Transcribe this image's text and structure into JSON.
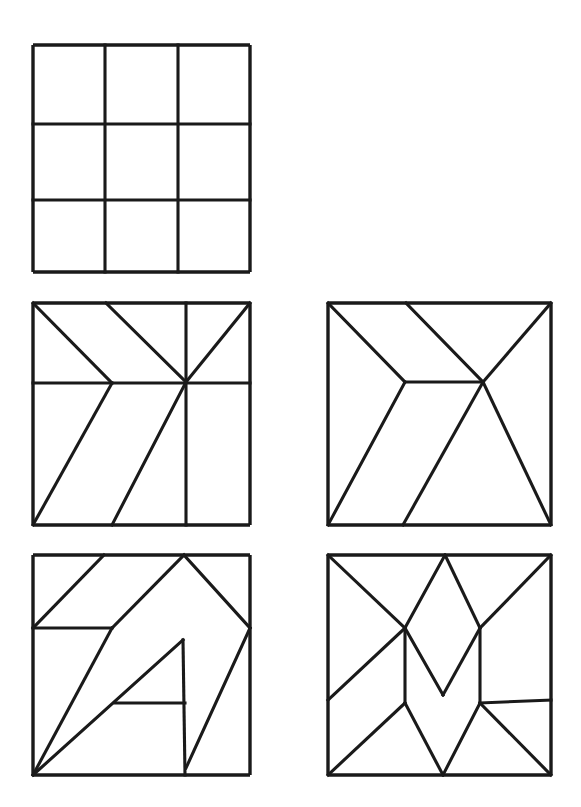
{
  "page": {
    "background_color": "#ffffff",
    "ink_color": "#1a1a1a",
    "width": 581,
    "height": 807
  },
  "figures": [
    {
      "id": "figure-1",
      "name": "three-by-three-grid",
      "label": "3x3 grid square",
      "box": {
        "x": 33,
        "y": 45,
        "w": 217,
        "h": 227
      },
      "segments": [
        [
          33,
          45,
          250,
          45
        ],
        [
          33,
          272,
          250,
          272
        ],
        [
          33,
          45,
          33,
          272
        ],
        [
          250,
          45,
          250,
          272
        ],
        [
          105,
          45,
          105,
          272
        ],
        [
          178,
          45,
          178,
          272
        ],
        [
          33,
          124,
          250,
          124
        ],
        [
          33,
          200,
          250,
          200
        ]
      ]
    },
    {
      "id": "figure-2",
      "name": "pinwheel-square",
      "label": "Pinwheel partitioned square",
      "box": {
        "x": 33,
        "y": 303,
        "w": 217,
        "h": 222
      },
      "segments": [
        [
          33,
          303,
          250,
          303
        ],
        [
          33,
          525,
          250,
          525
        ],
        [
          33,
          303,
          33,
          525
        ],
        [
          250,
          303,
          250,
          525
        ],
        [
          33,
          303,
          112,
          383
        ],
        [
          106,
          303,
          186,
          382
        ],
        [
          250,
          303,
          186,
          382
        ],
        [
          186,
          303,
          186,
          382
        ],
        [
          186,
          382,
          186,
          525
        ],
        [
          33,
          383,
          112,
          383
        ],
        [
          112,
          383,
          250,
          383
        ],
        [
          112,
          383,
          33,
          525
        ],
        [
          186,
          382,
          112,
          525
        ]
      ]
    },
    {
      "id": "figure-3",
      "name": "fan-square",
      "label": "Fan partitioned square",
      "box": {
        "x": 328,
        "y": 303,
        "w": 223,
        "h": 222
      },
      "segments": [
        [
          328,
          303,
          551,
          303
        ],
        [
          328,
          525,
          551,
          525
        ],
        [
          328,
          303,
          328,
          525
        ],
        [
          551,
          303,
          551,
          525
        ],
        [
          328,
          303,
          405,
          382
        ],
        [
          406,
          303,
          483,
          382
        ],
        [
          551,
          303,
          483,
          382
        ],
        [
          405,
          382,
          483,
          382
        ],
        [
          405,
          382,
          328,
          525
        ],
        [
          483,
          382,
          403,
          525
        ],
        [
          483,
          382,
          551,
          525
        ]
      ]
    },
    {
      "id": "figure-4",
      "name": "arrow-a-square",
      "label": "Arrow / letter-A partitioned square",
      "box": {
        "x": 33,
        "y": 555,
        "w": 217,
        "h": 220
      },
      "segments": [
        [
          33,
          555,
          250,
          555
        ],
        [
          33,
          775,
          250,
          775
        ],
        [
          33,
          555,
          33,
          775
        ],
        [
          250,
          555,
          250,
          775
        ],
        [
          104,
          555,
          33,
          628
        ],
        [
          33,
          628,
          112,
          628
        ],
        [
          112,
          628,
          184,
          555
        ],
        [
          184,
          555,
          250,
          628
        ],
        [
          112,
          628,
          33,
          775
        ],
        [
          33,
          775,
          183,
          640
        ],
        [
          183,
          640,
          185,
          775
        ],
        [
          115,
          703,
          185,
          703
        ],
        [
          250,
          628,
          186,
          768
        ]
      ]
    },
    {
      "id": "figure-5",
      "name": "zigzag-m-square",
      "label": "Zig-zag / letter-M partitioned square",
      "box": {
        "x": 328,
        "y": 555,
        "w": 223,
        "h": 220
      },
      "segments": [
        [
          328,
          555,
          551,
          555
        ],
        [
          328,
          775,
          551,
          775
        ],
        [
          328,
          555,
          328,
          775
        ],
        [
          551,
          555,
          551,
          775
        ],
        [
          328,
          555,
          405,
          628
        ],
        [
          445,
          555,
          405,
          628
        ],
        [
          445,
          555,
          480,
          628
        ],
        [
          551,
          555,
          480,
          628
        ],
        [
          405,
          628,
          328,
          700
        ],
        [
          405,
          628,
          405,
          703
        ],
        [
          405,
          628,
          443,
          695
        ],
        [
          443,
          695,
          480,
          628
        ],
        [
          480,
          628,
          480,
          703
        ],
        [
          480,
          703,
          551,
          700
        ],
        [
          405,
          703,
          328,
          775
        ],
        [
          405,
          703,
          443,
          775
        ],
        [
          480,
          703,
          443,
          775
        ],
        [
          480,
          703,
          551,
          775
        ]
      ]
    }
  ]
}
